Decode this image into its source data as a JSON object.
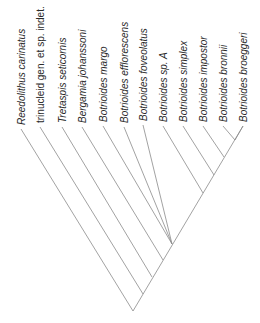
{
  "diagram": {
    "type": "cladogram",
    "taxa": [
      {
        "label": "Reedolithus carinatus",
        "italic": true,
        "tip": [
          21,
          129
        ],
        "node": [
          133,
          311
        ]
      },
      {
        "label": "trinucleid gen. et sp. indet.",
        "italic": false,
        "tip": [
          40,
          127
        ],
        "node": [
          143,
          294
        ]
      },
      {
        "label": "Tretaspis seticornis",
        "italic": true,
        "tip": [
          62,
          127
        ],
        "node": [
          152,
          277
        ]
      },
      {
        "label": "Bergamia johanssoni",
        "italic": true,
        "tip": [
          82,
          127
        ],
        "node": [
          163,
          260
        ]
      },
      {
        "label": "Botrioides margo",
        "italic": true,
        "tip": [
          103,
          126
        ],
        "node": [
          172,
          244
        ]
      },
      {
        "label": "Botrioides efflorescens",
        "italic": true,
        "tip": [
          124,
          127
        ],
        "node": [
          172,
          244
        ]
      },
      {
        "label": "Botrioides foveolatus",
        "italic": true,
        "tip": [
          143,
          125
        ],
        "node": [
          172,
          244
        ]
      },
      {
        "label": "Botrioides sp. A",
        "italic": true,
        "tip": [
          163,
          126
        ],
        "node": [
          203,
          193
        ]
      },
      {
        "label": "Botrioides simplex",
        "italic": true,
        "tip": [
          183,
          126
        ],
        "node": [
          214,
          175
        ]
      },
      {
        "label": "Botrioides impostor",
        "italic": true,
        "tip": [
          203,
          126
        ],
        "node": [
          224,
          157
        ]
      },
      {
        "label": "Botrioides bronnii",
        "italic": true,
        "tip": [
          223,
          126
        ],
        "node": [
          235,
          140
        ]
      },
      {
        "label": "Botrioides broeggeri",
        "italic": true,
        "tip": [
          243,
          126
        ],
        "node": [
          235,
          140
        ]
      }
    ],
    "spine": {
      "root": [
        133,
        311
      ],
      "top": [
        243,
        126
      ]
    },
    "colors": {
      "branch": "#8a8a8a",
      "label": "#2a2a2a",
      "background": "#ffffff"
    }
  }
}
